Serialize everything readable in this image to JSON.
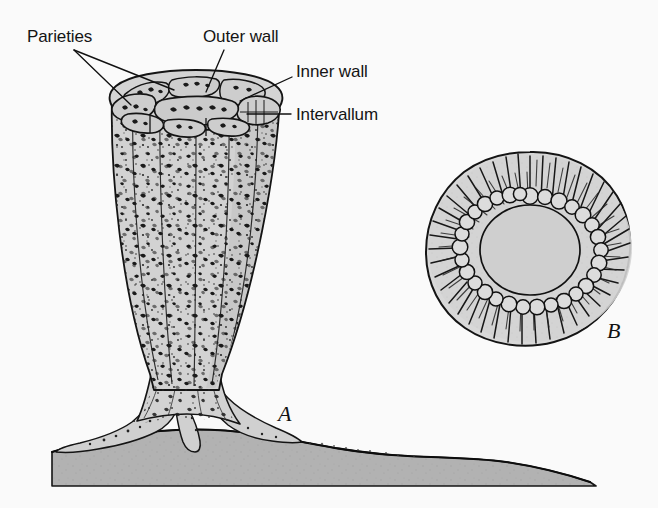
{
  "figure": {
    "background_color": "#fafafa",
    "ink_color": "#111111",
    "body_fill_color": "#d2d2d2",
    "substrate_fill_color": "#b0b0b0",
    "cavity_fill_color": "#cfcfcf"
  },
  "annotations": [
    {
      "id": "parieties",
      "label": "Parieties",
      "x": 27,
      "y": 28,
      "leader_from": [
        74,
        50
      ],
      "leader_to": [
        [
          128,
          103
        ],
        [
          172,
          88
        ]
      ]
    },
    {
      "id": "outer-wall",
      "label": "Outer wall",
      "x": 203,
      "y": 28,
      "leader_from": [
        224,
        50
      ],
      "leader_to": [
        [
          206,
          92
        ]
      ]
    },
    {
      "id": "inner-wall",
      "label": "Inner wall",
      "x": 296,
      "y": 63,
      "leader_from": [
        292,
        77
      ],
      "leader_to": [
        [
          240,
          101
        ]
      ]
    },
    {
      "id": "intervallum",
      "label": "Intervallum",
      "x": 296,
      "y": 106,
      "leader_from": [
        291,
        114
      ],
      "leader_to": [
        [
          246,
          114
        ]
      ]
    }
  ],
  "part_labels": [
    {
      "id": "part-a",
      "label": "A",
      "x": 278,
      "y": 403
    },
    {
      "id": "part-b",
      "label": "B",
      "x": 607,
      "y": 320
    }
  ],
  "figure_a": {
    "name": "longitudinal-view",
    "description": "Goblet-shaped archaeocyathid cup with porous double wall, ring of chambers at the rim, tapering stalk and root-like holdfast anchored on substrate",
    "rim_top_y": 72,
    "rim_left_x": 108,
    "rim_right_x": 284,
    "stalk_y": 392,
    "base_y": 448
  },
  "figure_b": {
    "name": "transverse-section",
    "description": "Cross-section showing radial septa in the intervallum, ring of rounded cells at the inner wall and open central cavity",
    "center_x": 530,
    "center_y": 248,
    "outer_radius_x": 102,
    "outer_radius_y": 94,
    "cavity_radius_x": 48,
    "cavity_radius_y": 43
  }
}
